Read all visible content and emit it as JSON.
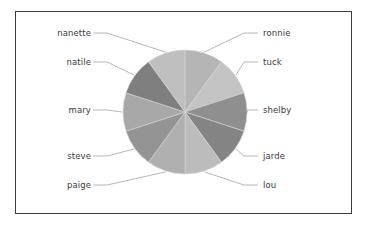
{
  "figure": {
    "background_color": "#ffffff",
    "frame_color": "#3a3c45"
  },
  "chart_data": {
    "type": "pie",
    "title": "",
    "xlabel": "",
    "ylabel": "",
    "legend_position": "none",
    "grid": false,
    "labels": [
      "ronnie",
      "tuck",
      "shelby",
      "jarde",
      "lou",
      "paige",
      "steve",
      "mary",
      "natile",
      "nanette"
    ],
    "values": [
      10,
      10,
      10,
      10,
      10,
      10,
      10,
      10,
      10,
      10
    ],
    "start_angle_deg": 90,
    "direction": "clockwise",
    "slices": [
      {
        "label": "ronnie",
        "value": 10,
        "color": "#b5b5b5",
        "start_deg": 90,
        "end_deg": 54,
        "label_side": "right"
      },
      {
        "label": "tuck",
        "value": 10,
        "color": "#c3c3c3",
        "start_deg": 54,
        "end_deg": 18,
        "label_side": "right"
      },
      {
        "label": "shelby",
        "value": 10,
        "color": "#8f8f8f",
        "start_deg": 18,
        "end_deg": -18,
        "label_side": "right"
      },
      {
        "label": "jarde",
        "value": 10,
        "color": "#848484",
        "start_deg": -18,
        "end_deg": -54,
        "label_side": "right"
      },
      {
        "label": "lou",
        "value": 10,
        "color": "#bcbcbc",
        "start_deg": -54,
        "end_deg": -90,
        "label_side": "right"
      },
      {
        "label": "paige",
        "value": 10,
        "color": "#b0b0b0",
        "start_deg": -90,
        "end_deg": -126,
        "label_side": "left"
      },
      {
        "label": "steve",
        "value": 10,
        "color": "#949494",
        "start_deg": -126,
        "end_deg": -162,
        "label_side": "left"
      },
      {
        "label": "mary",
        "value": 10,
        "color": "#a8a8a8",
        "start_deg": -162,
        "end_deg": -198,
        "label_side": "left"
      },
      {
        "label": "natile",
        "value": 10,
        "color": "#7f7f7f",
        "start_deg": -198,
        "end_deg": -234,
        "label_side": "left"
      },
      {
        "label": "nanette",
        "value": 10,
        "color": "#bfbfbf",
        "start_deg": -234,
        "end_deg": -270,
        "label_side": "left"
      }
    ],
    "center": {
      "x": 185,
      "y": 112
    },
    "radius": 62,
    "leader_line_color": "#9a9a9a"
  },
  "labels": {
    "nanette": "nanette",
    "natile": "natile",
    "mary": "mary",
    "steve": "steve",
    "paige": "paige",
    "ronnie": "ronnie",
    "tuck": "tuck",
    "shelby": "shelby",
    "jarde": "jarde",
    "lou": "lou"
  }
}
